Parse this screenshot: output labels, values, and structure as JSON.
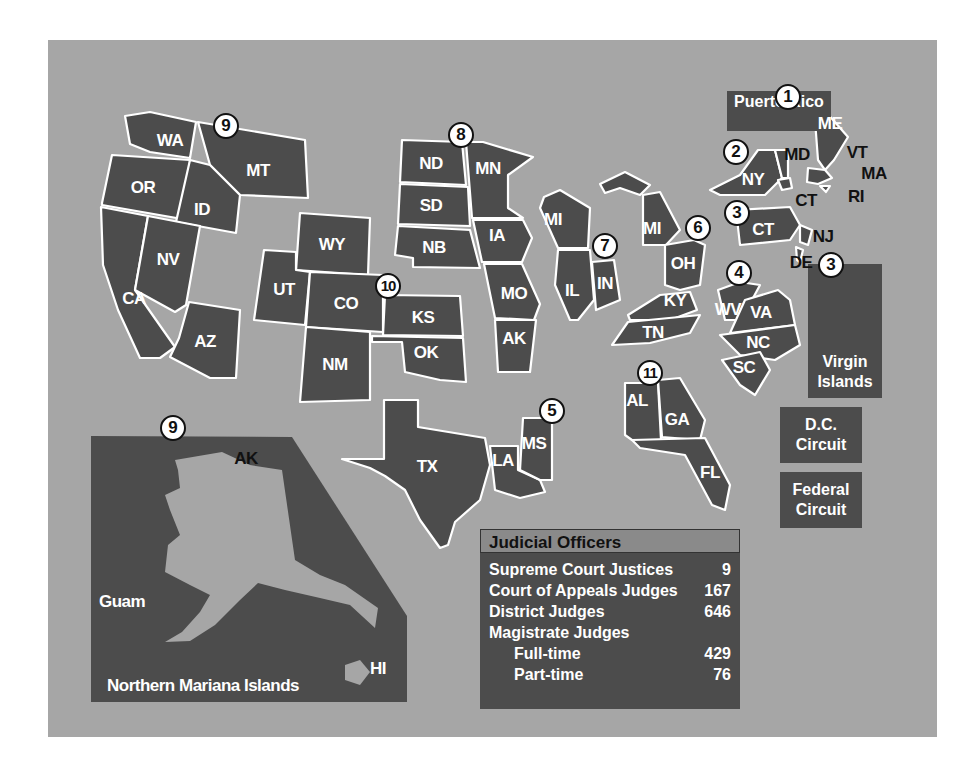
{
  "colors": {
    "background": "#a6a6a6",
    "state_fill": "#4c4c4c",
    "border": "#ffffff",
    "header": "#8a8a8a"
  },
  "circuits": [
    {
      "id": "1",
      "label": "1",
      "x": 788,
      "y": 97,
      "states": [
        "ME",
        "VT",
        "MA",
        "RI",
        "Puerto Rico"
      ]
    },
    {
      "id": "2",
      "label": "2",
      "x": 736,
      "y": 152,
      "states": [
        "NY",
        "CT",
        "VT"
      ]
    },
    {
      "id": "3a",
      "label": "3",
      "x": 737,
      "y": 213,
      "states": [
        "PA",
        "NJ",
        "DE"
      ]
    },
    {
      "id": "3b",
      "label": "3",
      "x": 831,
      "y": 265,
      "states": [
        "Virgin Islands"
      ]
    },
    {
      "id": "4",
      "label": "4",
      "x": 739,
      "y": 273,
      "states": [
        "WV",
        "VA",
        "NC",
        "SC",
        "MD"
      ]
    },
    {
      "id": "5",
      "label": "5",
      "x": 552,
      "y": 411,
      "states": [
        "TX",
        "LA",
        "MS"
      ]
    },
    {
      "id": "6",
      "label": "6",
      "x": 698,
      "y": 228,
      "states": [
        "MI",
        "OH",
        "KY",
        "TN"
      ]
    },
    {
      "id": "7",
      "label": "7",
      "x": 605,
      "y": 246,
      "states": [
        "WI",
        "IL",
        "IN"
      ]
    },
    {
      "id": "8",
      "label": "8",
      "x": 461,
      "y": 135,
      "states": [
        "ND",
        "SD",
        "NB",
        "MN",
        "IA",
        "MO",
        "AR"
      ]
    },
    {
      "id": "9a",
      "label": "9",
      "x": 226,
      "y": 126,
      "states": [
        "WA",
        "OR",
        "CA",
        "NV",
        "ID",
        "MT",
        "AZ"
      ]
    },
    {
      "id": "9b",
      "label": "9",
      "x": 173,
      "y": 428,
      "states": [
        "AK",
        "HI",
        "Guam",
        "Northern Mariana Islands"
      ]
    },
    {
      "id": "10",
      "label": "10",
      "x": 388,
      "y": 286,
      "states": [
        "WY",
        "UT",
        "CO",
        "KS",
        "OK",
        "NM"
      ]
    },
    {
      "id": "11",
      "label": "11",
      "x": 650,
      "y": 373,
      "states": [
        "AL",
        "GA",
        "FL"
      ]
    }
  ],
  "state_labels": [
    {
      "t": "WA",
      "x": 170,
      "y": 141
    },
    {
      "t": "MT",
      "x": 258,
      "y": 171
    },
    {
      "t": "OR",
      "x": 143,
      "y": 188
    },
    {
      "t": "ID",
      "x": 202,
      "y": 210
    },
    {
      "t": "NV",
      "x": 168,
      "y": 260
    },
    {
      "t": "CA",
      "x": 134,
      "y": 299
    },
    {
      "t": "AZ",
      "x": 205,
      "y": 342
    },
    {
      "t": "WY",
      "x": 332,
      "y": 245
    },
    {
      "t": "UT",
      "x": 284,
      "y": 290
    },
    {
      "t": "CO",
      "x": 346,
      "y": 304
    },
    {
      "t": "NM",
      "x": 335,
      "y": 365
    },
    {
      "t": "KS",
      "x": 423,
      "y": 318
    },
    {
      "t": "OK",
      "x": 426,
      "y": 353
    },
    {
      "t": "ND",
      "x": 431,
      "y": 164
    },
    {
      "t": "SD",
      "x": 431,
      "y": 206
    },
    {
      "t": "NB",
      "x": 434,
      "y": 248
    },
    {
      "t": "MN",
      "x": 488,
      "y": 169
    },
    {
      "t": "IA",
      "x": 497,
      "y": 236
    },
    {
      "t": "MO",
      "x": 514,
      "y": 294
    },
    {
      "t": "AK",
      "x": 514,
      "y": 339
    },
    {
      "t": "MI",
      "x": 553,
      "y": 220
    },
    {
      "t": "IL",
      "x": 572,
      "y": 291
    },
    {
      "t": "IN",
      "x": 605,
      "y": 284
    },
    {
      "t": "MI",
      "x": 652,
      "y": 229
    },
    {
      "t": "OH",
      "x": 683,
      "y": 264
    },
    {
      "t": "KY",
      "x": 675,
      "y": 301
    },
    {
      "t": "TN",
      "x": 653,
      "y": 333
    },
    {
      "t": "NY",
      "x": 753,
      "y": 180
    },
    {
      "t": "CT",
      "x": 763,
      "y": 230
    },
    {
      "t": "WV",
      "x": 728,
      "y": 310
    },
    {
      "t": "VA",
      "x": 761,
      "y": 313
    },
    {
      "t": "NC",
      "x": 758,
      "y": 343
    },
    {
      "t": "SC",
      "x": 744,
      "y": 368
    },
    {
      "t": "TX",
      "x": 427,
      "y": 467
    },
    {
      "t": "LA",
      "x": 503,
      "y": 461
    },
    {
      "t": "MS",
      "x": 534,
      "y": 444
    },
    {
      "t": "AL",
      "x": 637,
      "y": 401
    },
    {
      "t": "GA",
      "x": 677,
      "y": 420
    },
    {
      "t": "FL",
      "x": 710,
      "y": 473
    },
    {
      "t": "ME",
      "x": 830,
      "y": 124
    },
    {
      "t": "Guam",
      "x": 122,
      "y": 602
    },
    {
      "t": "HI",
      "x": 378,
      "y": 669
    },
    {
      "t": "Northern Mariana Islands",
      "x": 203,
      "y": 686
    }
  ],
  "callout_labels": [
    {
      "t": "MD",
      "x": 797,
      "y": 155
    },
    {
      "t": "VT",
      "x": 857,
      "y": 153
    },
    {
      "t": "MA",
      "x": 874,
      "y": 174
    },
    {
      "t": "RI",
      "x": 856,
      "y": 197
    },
    {
      "t": "CT",
      "x": 806,
      "y": 201
    },
    {
      "t": "NJ",
      "x": 823,
      "y": 237
    },
    {
      "t": "DE",
      "x": 801,
      "y": 263
    },
    {
      "t": "AK",
      "x": 246,
      "y": 459
    }
  ],
  "side_boxes": [
    {
      "id": "puerto-rico",
      "label": "Puerto Rico",
      "x": 727,
      "y": 91,
      "w": 104,
      "h": 40
    },
    {
      "id": "virgin-islands",
      "label": "Virgin Islands",
      "x": 808,
      "y": 264,
      "w": 74,
      "h": 134,
      "label_top": 90
    },
    {
      "id": "dc-circuit",
      "label": "D.C. Circuit",
      "x": 780,
      "y": 407,
      "w": 82,
      "h": 56
    },
    {
      "id": "federal-circuit",
      "label": "Federal Circuit",
      "x": 780,
      "y": 472,
      "w": 82,
      "h": 56
    }
  ],
  "judicial_officers": {
    "title": "Judicial Officers",
    "rows": [
      {
        "label": "Supreme Court Justices",
        "value": "9",
        "indent": false
      },
      {
        "label": "Court of Appeals Judges",
        "value": "167",
        "indent": false
      },
      {
        "label": "District Judges",
        "value": "646",
        "indent": false
      },
      {
        "label": "Magistrate Judges",
        "value": "",
        "indent": false
      },
      {
        "label": "Full-time",
        "value": "429",
        "indent": true
      },
      {
        "label": "Part-time",
        "value": "76",
        "indent": true
      }
    ]
  }
}
